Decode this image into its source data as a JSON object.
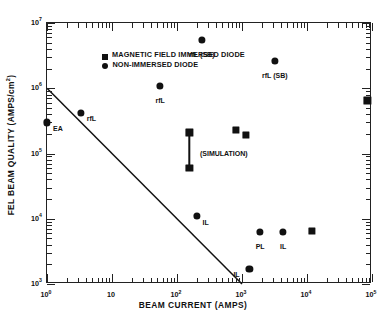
{
  "chart_data": {
    "type": "scatter",
    "title": "",
    "xlabel": "BEAM CURRENT (AMPS)",
    "ylabel": "FEL BEAM QUALITY (AMPS/cm²)",
    "ylabel_text": "FEL BEAM QUALITY (AMPS/cm",
    "ylabel_sup": "2",
    "ylabel_tail": ")",
    "xscale": "log",
    "yscale": "log",
    "xlim": [
      1,
      100000
    ],
    "ylim": [
      1000,
      10000000
    ],
    "grid": false,
    "legend_position": "top-left",
    "legend": [
      {
        "marker": "square",
        "label": "MAGNETIC FIELD IMMERSED DIODE"
      },
      {
        "marker": "circle",
        "label": "NON-IMMERSED DIODE"
      }
    ],
    "xticks": [
      {
        "value": 1,
        "label": "10",
        "exp": "0"
      },
      {
        "value": 10,
        "label": "10",
        "exp": ""
      },
      {
        "value": 100,
        "label": "10",
        "exp": "2"
      },
      {
        "value": 1000,
        "label": "10",
        "exp": "3"
      },
      {
        "value": 10000,
        "label": "10",
        "exp": "4"
      },
      {
        "value": 100000,
        "label": "10",
        "exp": "5"
      }
    ],
    "yticks": [
      {
        "value": 1000,
        "label": "10",
        "exp": "3"
      },
      {
        "value": 10000,
        "label": "10",
        "exp": "4"
      },
      {
        "value": 100000,
        "label": "10",
        "exp": "5"
      },
      {
        "value": 1000000,
        "label": "10",
        "exp": "6"
      },
      {
        "value": 10000000,
        "label": "10",
        "exp": "7"
      }
    ],
    "series": [
      {
        "name": "NON-IMMERSED DIODE",
        "marker": "circle",
        "points": [
          {
            "x": 1.0,
            "y": 300000.0,
            "label": "EA",
            "lab_dx": 6,
            "lab_dy": 2.5
          },
          {
            "x": 3.3,
            "y": 420000.0,
            "label": "rfL",
            "lab_dx": 6,
            "lab_dy": 2.5
          },
          {
            "x": 55,
            "y": 1100000.0,
            "label": "rfL",
            "lab_dx": 0,
            "lab_dy": 11,
            "lab_center": true
          },
          {
            "x": 240,
            "y": 5500000.0,
            "label": "rfL (SB)",
            "lab_dx": 0,
            "lab_dy": 11,
            "lab_center": true
          },
          {
            "x": 3200,
            "y": 2600000.0,
            "label": "rfL (SB)",
            "lab_dx": 0,
            "lab_dy": 11,
            "lab_center": true
          },
          {
            "x": 200,
            "y": 11000.0,
            "label": "IL",
            "lab_dx": 6,
            "lab_dy": 2.5
          },
          {
            "x": 1900,
            "y": 6200.0,
            "label": "PL",
            "lab_dx": 0,
            "lab_dy": 11,
            "lab_center": true
          },
          {
            "x": 4300,
            "y": 6200.0,
            "label": "IL",
            "lab_dx": 0,
            "lab_dy": 11,
            "lab_center": true
          },
          {
            "x": 1300,
            "y": 1700.0,
            "label": "IL",
            "lab_dx": -16,
            "lab_dy": 2.5
          }
        ]
      },
      {
        "name": "MAGNETIC FIELD IMMERSED DIODE",
        "marker": "square",
        "points": [
          {
            "x": 155,
            "y": 210000.0,
            "label": "",
            "lab_dx": 0,
            "lab_dy": 0
          },
          {
            "x": 155,
            "y": 60000.0,
            "label": "",
            "lab_dx": 0,
            "lab_dy": 0
          },
          {
            "x": 800,
            "y": 230000.0,
            "label": "",
            "lab_dx": 0,
            "lab_dy": 0
          },
          {
            "x": 1150,
            "y": 190000.0,
            "label": "(SIMULATION)",
            "lab_dx": -46,
            "lab_dy": 15
          },
          {
            "x": 12000,
            "y": 6600.0,
            "label": "",
            "lab_dx": 0,
            "lab_dy": 0
          },
          {
            "x": 85000,
            "y": 650000.0,
            "label": "",
            "lab_dx": 0,
            "lab_dy": 0
          }
        ]
      }
    ],
    "errorbars": [
      {
        "x": 155,
        "y_top": 210000.0,
        "y_bottom": 60000.0
      }
    ],
    "trendline": {
      "x0": 1,
      "y0": 1000000.0,
      "x1": 1000,
      "y1": 1000.0,
      "slope_log": -1.0
    },
    "annotations": [
      {
        "text": "(SIMULATION)",
        "x": 1150,
        "y": 190000.0
      }
    ]
  }
}
